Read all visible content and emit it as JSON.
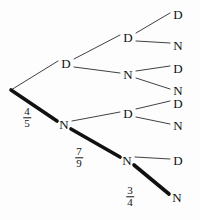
{
  "figure": {
    "name": "probability-tree-diagram",
    "background_color": "#fdfdfd",
    "ink_color": "#141414",
    "width": 200,
    "height": 220
  },
  "nodes": {
    "root": {
      "label": "",
      "x": 11,
      "y": 90
    },
    "level1": [
      {
        "id": "L1-D",
        "label": "D",
        "x": 66,
        "y": 63
      },
      {
        "id": "L1-N",
        "label": "N",
        "x": 64,
        "y": 124
      }
    ],
    "level2": [
      {
        "id": "L2-DD",
        "label": "D",
        "x": 128,
        "y": 37
      },
      {
        "id": "L2-DN",
        "label": "N",
        "x": 128,
        "y": 74
      },
      {
        "id": "L2-ND",
        "label": "D",
        "x": 128,
        "y": 113
      },
      {
        "id": "L2-NN",
        "label": "N",
        "x": 127,
        "y": 160
      }
    ],
    "level3": [
      {
        "id": "L3-DDD",
        "label": "D",
        "x": 178,
        "y": 14
      },
      {
        "id": "L3-DDN",
        "label": "N",
        "x": 178,
        "y": 45
      },
      {
        "id": "L3-DND",
        "label": "D",
        "x": 178,
        "y": 68
      },
      {
        "id": "L3-DNN",
        "label": "N",
        "x": 178,
        "y": 90
      },
      {
        "id": "L3-NDD",
        "label": "D",
        "x": 178,
        "y": 103
      },
      {
        "id": "L3-NDN",
        "label": "N",
        "x": 178,
        "y": 125
      },
      {
        "id": "L3-NND",
        "label": "D",
        "x": 178,
        "y": 160
      },
      {
        "id": "L3-NNN",
        "label": "N",
        "x": 177,
        "y": 197
      }
    ]
  },
  "edges": [
    {
      "id": "root-to-L1D",
      "from": [
        11,
        90
      ],
      "to": [
        58,
        61
      ],
      "weight": "thin"
    },
    {
      "id": "root-to-L1N",
      "from": [
        11,
        90
      ],
      "to": [
        57,
        121
      ],
      "weight": "thick"
    },
    {
      "id": "L1D-to-L2DD",
      "from": [
        74,
        59
      ],
      "to": [
        120,
        35
      ],
      "weight": "thin"
    },
    {
      "id": "L1D-to-L2DN",
      "from": [
        74,
        67
      ],
      "to": [
        120,
        73
      ],
      "weight": "thin"
    },
    {
      "id": "L1N-to-L2ND",
      "from": [
        72,
        121
      ],
      "to": [
        120,
        112
      ],
      "weight": "thin"
    },
    {
      "id": "L1N-to-L2NN",
      "from": [
        71,
        129
      ],
      "to": [
        120,
        157
      ],
      "weight": "thick"
    },
    {
      "id": "L2DD-to-L3DDD",
      "from": [
        136,
        33
      ],
      "to": [
        170,
        13
      ],
      "weight": "thin"
    },
    {
      "id": "L2DD-to-L3DDN",
      "from": [
        136,
        41
      ],
      "to": [
        170,
        43
      ],
      "weight": "thin"
    },
    {
      "id": "L2DN-to-L3DND",
      "from": [
        136,
        71
      ],
      "to": [
        170,
        66
      ],
      "weight": "thin"
    },
    {
      "id": "L2DN-to-L3DNN",
      "from": [
        136,
        78
      ],
      "to": [
        170,
        89
      ],
      "weight": "thin"
    },
    {
      "id": "L2ND-to-L3NDD",
      "from": [
        136,
        109
      ],
      "to": [
        170,
        101
      ],
      "weight": "thin"
    },
    {
      "id": "L2ND-to-L3NDN",
      "from": [
        136,
        117
      ],
      "to": [
        170,
        124
      ],
      "weight": "thin"
    },
    {
      "id": "L2NN-to-L3NND",
      "from": [
        135,
        157
      ],
      "to": [
        170,
        159
      ],
      "weight": "thin"
    },
    {
      "id": "L2NN-to-L3NNN",
      "from": [
        134,
        165
      ],
      "to": [
        169,
        194
      ],
      "weight": "thick"
    }
  ],
  "fractions": [
    {
      "id": "frac-root-N",
      "numerator": "4",
      "denominator": "5",
      "x": 27,
      "y": 118
    },
    {
      "id": "frac-L1N-L2NN",
      "numerator": "7",
      "denominator": "9",
      "x": 79,
      "y": 158
    },
    {
      "id": "frac-L2NN-L3NNN",
      "numerator": "3",
      "denominator": "4",
      "x": 130,
      "y": 197
    }
  ]
}
